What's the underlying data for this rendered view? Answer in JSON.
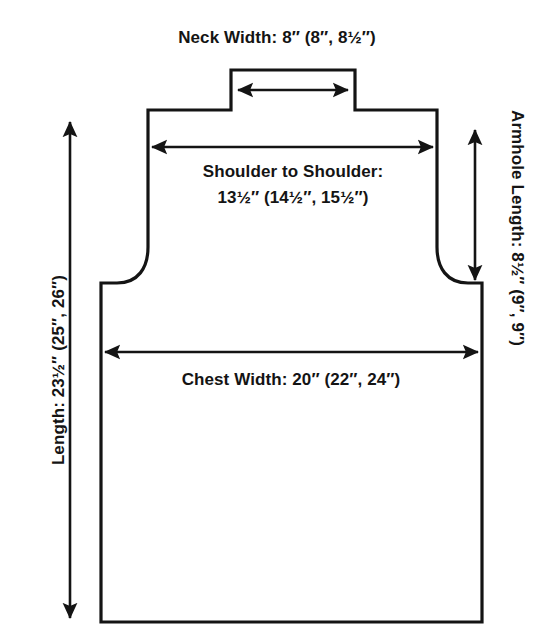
{
  "diagram": {
    "type": "sweater-front-schematic",
    "stroke_color": "#141414",
    "background_color": "#ffffff",
    "text_color": "#141414"
  },
  "labels": {
    "neck_width": "Neck Width:   8″ (8″, 8½″)",
    "shoulder_line1": "Shoulder to Shoulder:",
    "shoulder_line2": "13½″ (14½″, 15½″)",
    "chest_width": "Chest Width:   20″ (22″, 24″)",
    "length": "Length:   23½″ (25″, 26″)",
    "armhole_length": "Armhole Length: 8½″ (9″, 9″)"
  },
  "measurements": {
    "neck_width": {
      "name": "Neck Width",
      "values": [
        "8″",
        "8″",
        "8½″"
      ]
    },
    "shoulder_to_shoulder": {
      "name": "Shoulder to Shoulder",
      "values": [
        "13½″",
        "14½″",
        "15½″"
      ]
    },
    "chest_width": {
      "name": "Chest Width",
      "values": [
        "20″",
        "22″",
        "24″"
      ]
    },
    "length": {
      "name": "Length",
      "values": [
        "23½″",
        "25″",
        "26″"
      ]
    },
    "armhole_length": {
      "name": "Armhole Length",
      "values": [
        "8½″",
        "9″",
        "9″"
      ]
    }
  }
}
